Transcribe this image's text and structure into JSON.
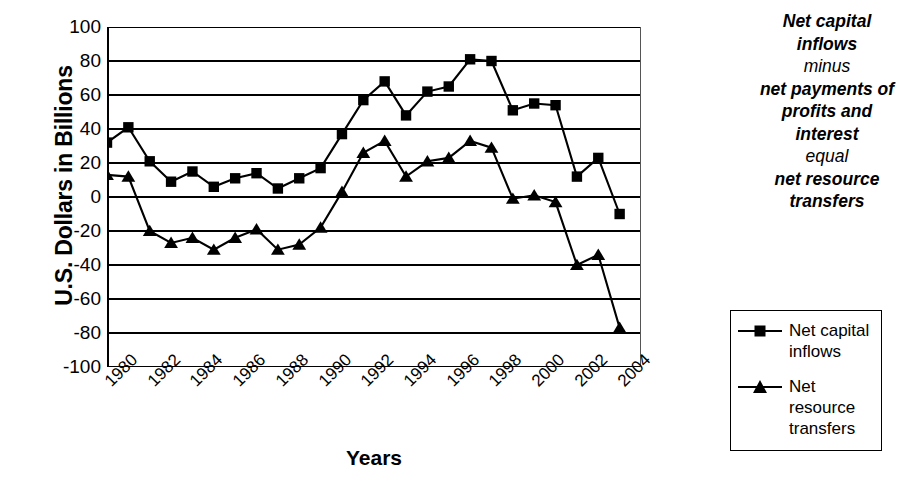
{
  "chart_data": {
    "type": "line",
    "title": "",
    "xlabel": "Years",
    "ylabel": "U.S. Dollars in Billions",
    "ylim": [
      -100,
      100
    ],
    "ytick_step": 20,
    "yticks": [
      "100",
      "80",
      "60",
      "40",
      "20",
      "0",
      "-20",
      "-40",
      "-60",
      "-80",
      "-100"
    ],
    "grid": true,
    "legend_position": "right",
    "x": [
      1980,
      1981,
      1982,
      1983,
      1984,
      1985,
      1986,
      1987,
      1988,
      1989,
      1990,
      1991,
      1992,
      1993,
      1994,
      1995,
      1996,
      1997,
      1998,
      1999,
      2000,
      2001,
      2002,
      2003,
      2004
    ],
    "xtick_labels": [
      "1980",
      "1982",
      "1984",
      "1986",
      "1988",
      "1990",
      "1992",
      "1994",
      "1996",
      "1998",
      "2000",
      "2002",
      "2004"
    ],
    "xtick_values": [
      1980,
      1982,
      1984,
      1986,
      1988,
      1990,
      1992,
      1994,
      1996,
      1998,
      2000,
      2002,
      2004
    ],
    "series": [
      {
        "name": "Net capital inflows",
        "marker": "square",
        "color": "#000000",
        "values": [
          32,
          41,
          21,
          9,
          15,
          6,
          11,
          14,
          5,
          11,
          17,
          37,
          57,
          68,
          48,
          62,
          65,
          81,
          80,
          51,
          55,
          54,
          12,
          23,
          -10
        ]
      },
      {
        "name": "Net resource transfers",
        "marker": "triangle",
        "color": "#000000",
        "values": [
          13,
          12,
          -20,
          -27,
          -24,
          -31,
          -24,
          -19,
          -31,
          -28,
          -18,
          3,
          26,
          33,
          12,
          21,
          23,
          33,
          29,
          -1,
          1,
          -3,
          -40,
          -34,
          -77
        ]
      }
    ]
  },
  "axes": {
    "y_title": "U.S. Dollars in Billions",
    "x_title": "Years"
  },
  "caption": {
    "lines": [
      {
        "text": "Net capital",
        "weight": "strong"
      },
      {
        "text": "inflows",
        "weight": "strong"
      },
      {
        "text": "minus",
        "weight": "light"
      },
      {
        "text": "net payments of",
        "weight": "strong"
      },
      {
        "text": "profits and",
        "weight": "strong"
      },
      {
        "text": "interest",
        "weight": "strong"
      },
      {
        "text": "equal",
        "weight": "light"
      },
      {
        "text": "net resource",
        "weight": "strong"
      },
      {
        "text": "transfers",
        "weight": "strong"
      }
    ]
  },
  "legend": {
    "items": [
      {
        "label": "Net capital inflows",
        "marker": "square"
      },
      {
        "label": "Net resource transfers",
        "marker": "triangle"
      }
    ]
  }
}
